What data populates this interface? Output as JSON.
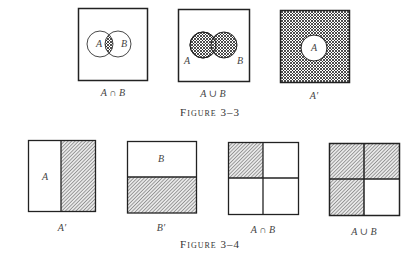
{
  "figure_3_3": {
    "caption": "Figure 3–3",
    "panels": [
      {
        "label": "A ∩ B",
        "set_a": "A",
        "set_b": "B",
        "shaded": "intersection"
      },
      {
        "label": "A ∪ B",
        "set_a": "A",
        "set_b": "B",
        "shaded": "union"
      },
      {
        "label": "A′",
        "set_a": "A",
        "shaded": "complement of A"
      }
    ]
  },
  "figure_3_4": {
    "caption": "Figure 3–4",
    "panels": [
      {
        "label": "A′",
        "region_label": "A",
        "shaded": "right half"
      },
      {
        "label": "B′",
        "region_label": "B",
        "shaded": "bottom half"
      },
      {
        "label": "A ∩ B",
        "shaded": "top-left quadrant"
      },
      {
        "label": "A ∪ B",
        "shaded": "all but bottom-right quadrant"
      }
    ]
  }
}
